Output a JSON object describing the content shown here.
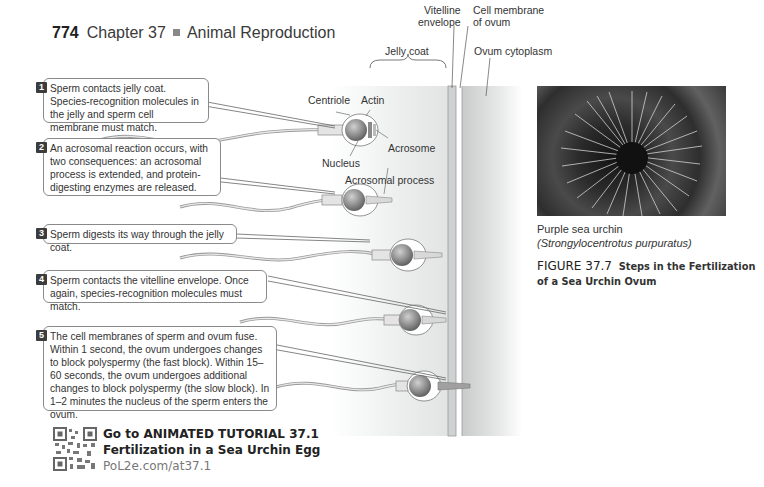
{
  "header": {
    "page_number": "774",
    "chapter": "Chapter 37",
    "chapter_title": "Animal Reproduction"
  },
  "steps": [
    {
      "number": "1",
      "text": "Sperm contacts jelly coat. Species-recognition molecules in the jelly and sperm cell membrane must match."
    },
    {
      "number": "2",
      "text": "An acrosomal reaction occurs, with two consequences: an acrosomal process is extended, and protein-digesting enzymes are released."
    },
    {
      "number": "3",
      "text": "Sperm digests its way through the jelly coat."
    },
    {
      "number": "4",
      "text": "Sperm contacts the vitelline envelope. Once again, species-recognition molecules must match."
    },
    {
      "number": "5",
      "text": "The cell membranes of sperm and ovum fuse. Within 1 second, the ovum undergoes changes to block polyspermy (the fast block). Within 15–60 seconds, the ovum undergoes additional changes to block polyspermy (the slow block). In 1–2 minutes the nucleus of the sperm enters the ovum."
    }
  ],
  "diagram_labels": {
    "vitelline_envelope_1": "Vitelline",
    "vitelline_envelope_2": "envelope",
    "cell_membrane_1": "Cell membrane",
    "cell_membrane_2": "of ovum",
    "jelly_coat": "Jelly coat",
    "ovum_cytoplasm": "Ovum cytoplasm",
    "centriole": "Centriole",
    "actin": "Actin",
    "acrosome": "Acrosome",
    "nucleus": "Nucleus",
    "acrosomal_process": "Acrosomal process"
  },
  "photo": {
    "caption_common": "Purple sea urchin",
    "caption_scientific": "(Strongylocentrotus purpuratus)"
  },
  "figure": {
    "number": "FIGURE 37.7",
    "title": "Steps in the Fertilization of a Sea Urchin Ovum"
  },
  "tutorial": {
    "line1": "Go to ANIMATED TUTORIAL 37.1",
    "line2": "Fertilization in a Sea Urchin Egg",
    "link": "PoL2e.com/at37.1"
  }
}
